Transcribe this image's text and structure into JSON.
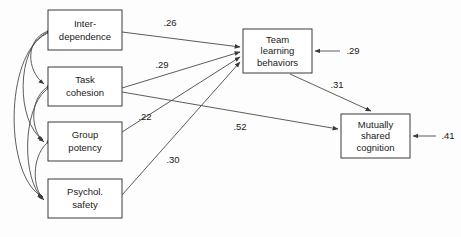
{
  "diagram": {
    "type": "structural-equation-path-diagram",
    "background_color": "#fdfdfd",
    "box_stroke_color": "#3a3a3a",
    "line_color": "#4a4a4a",
    "text_color": "#1a1a1a",
    "nodes": [
      {
        "id": "interdependence",
        "label_line1": "Inter-",
        "label_line2": "dependence",
        "x": 48,
        "y": 10,
        "w": 74,
        "h": 40
      },
      {
        "id": "task_cohesion",
        "label_line1": "Task",
        "label_line2": "cohesion",
        "x": 48,
        "y": 67,
        "w": 74,
        "h": 39
      },
      {
        "id": "group_potency",
        "label_line1": "Group",
        "label_line2": "potency",
        "x": 48,
        "y": 122,
        "w": 74,
        "h": 39
      },
      {
        "id": "psychol_safety",
        "label_line1": "Psychol.",
        "label_line2": "safety",
        "x": 48,
        "y": 179,
        "w": 74,
        "h": 39
      },
      {
        "id": "team_learning_behaviors",
        "label_line1": "Team",
        "label_line2": "learning",
        "label_line3": "behaviors",
        "x": 243,
        "y": 29,
        "w": 69,
        "h": 44
      },
      {
        "id": "mutually_shared_cognition",
        "label_line1": "Mutually",
        "label_line2": "shared",
        "label_line3": "cognition",
        "x": 341,
        "y": 114,
        "w": 69,
        "h": 44
      }
    ],
    "paths": [
      {
        "id": "path-interdependence-to-team-learning",
        "from": "interdependence",
        "to": "team_learning_behaviors",
        "coefficient": ".26",
        "label_x": 170,
        "label_y": 23
      },
      {
        "id": "path-task-cohesion-to-team-learning",
        "from": "task_cohesion",
        "to": "team_learning_behaviors",
        "coefficient": ".29",
        "label_x": 162,
        "label_y": 65
      },
      {
        "id": "path-group-potency-to-team-learning",
        "from": "group_potency",
        "to": "team_learning_behaviors",
        "coefficient": ".22",
        "label_x": 145,
        "label_y": 117
      },
      {
        "id": "path-psychol-safety-to-mutually-shared",
        "from": "psychol_safety",
        "to": "mutually_shared_cognition",
        "coefficient": ".30",
        "label_x": 173,
        "label_y": 160
      },
      {
        "id": "path-task-cohesion-to-mutually-shared",
        "from": "task_cohesion",
        "to": "mutually_shared_cognition",
        "coefficient": ".52",
        "label_x": 240,
        "label_y": 127
      },
      {
        "id": "path-team-learning-to-mutually-shared",
        "from": "team_learning_behaviors",
        "to": "mutually_shared_cognition",
        "coefficient": ".31",
        "label_x": 337,
        "label_y": 85
      }
    ],
    "disturbances": [
      {
        "id": "disturbance-team-learning",
        "target": "team_learning_behaviors",
        "coefficient": ".29",
        "label_x": 353,
        "label_y": 51
      },
      {
        "id": "disturbance-mutually-shared",
        "target": "mutually_shared_cognition",
        "coefficient": ".41",
        "label_x": 448,
        "label_y": 136
      }
    ],
    "correlations": [
      {
        "id": "correlation-interdependence-task-cohesion",
        "between": [
          "interdependence",
          "task_cohesion"
        ]
      },
      {
        "id": "correlation-interdependence-group-potency",
        "between": [
          "interdependence",
          "group_potency"
        ]
      },
      {
        "id": "correlation-interdependence-psychol-safety",
        "between": [
          "interdependence",
          "psychol_safety"
        ]
      },
      {
        "id": "correlation-task-cohesion-group-potency",
        "between": [
          "task_cohesion",
          "group_potency"
        ]
      },
      {
        "id": "correlation-task-cohesion-psychol-safety",
        "between": [
          "task_cohesion",
          "psychol_safety"
        ]
      },
      {
        "id": "correlation-group-potency-psychol-safety",
        "between": [
          "group_potency",
          "psychol_safety"
        ]
      }
    ]
  }
}
